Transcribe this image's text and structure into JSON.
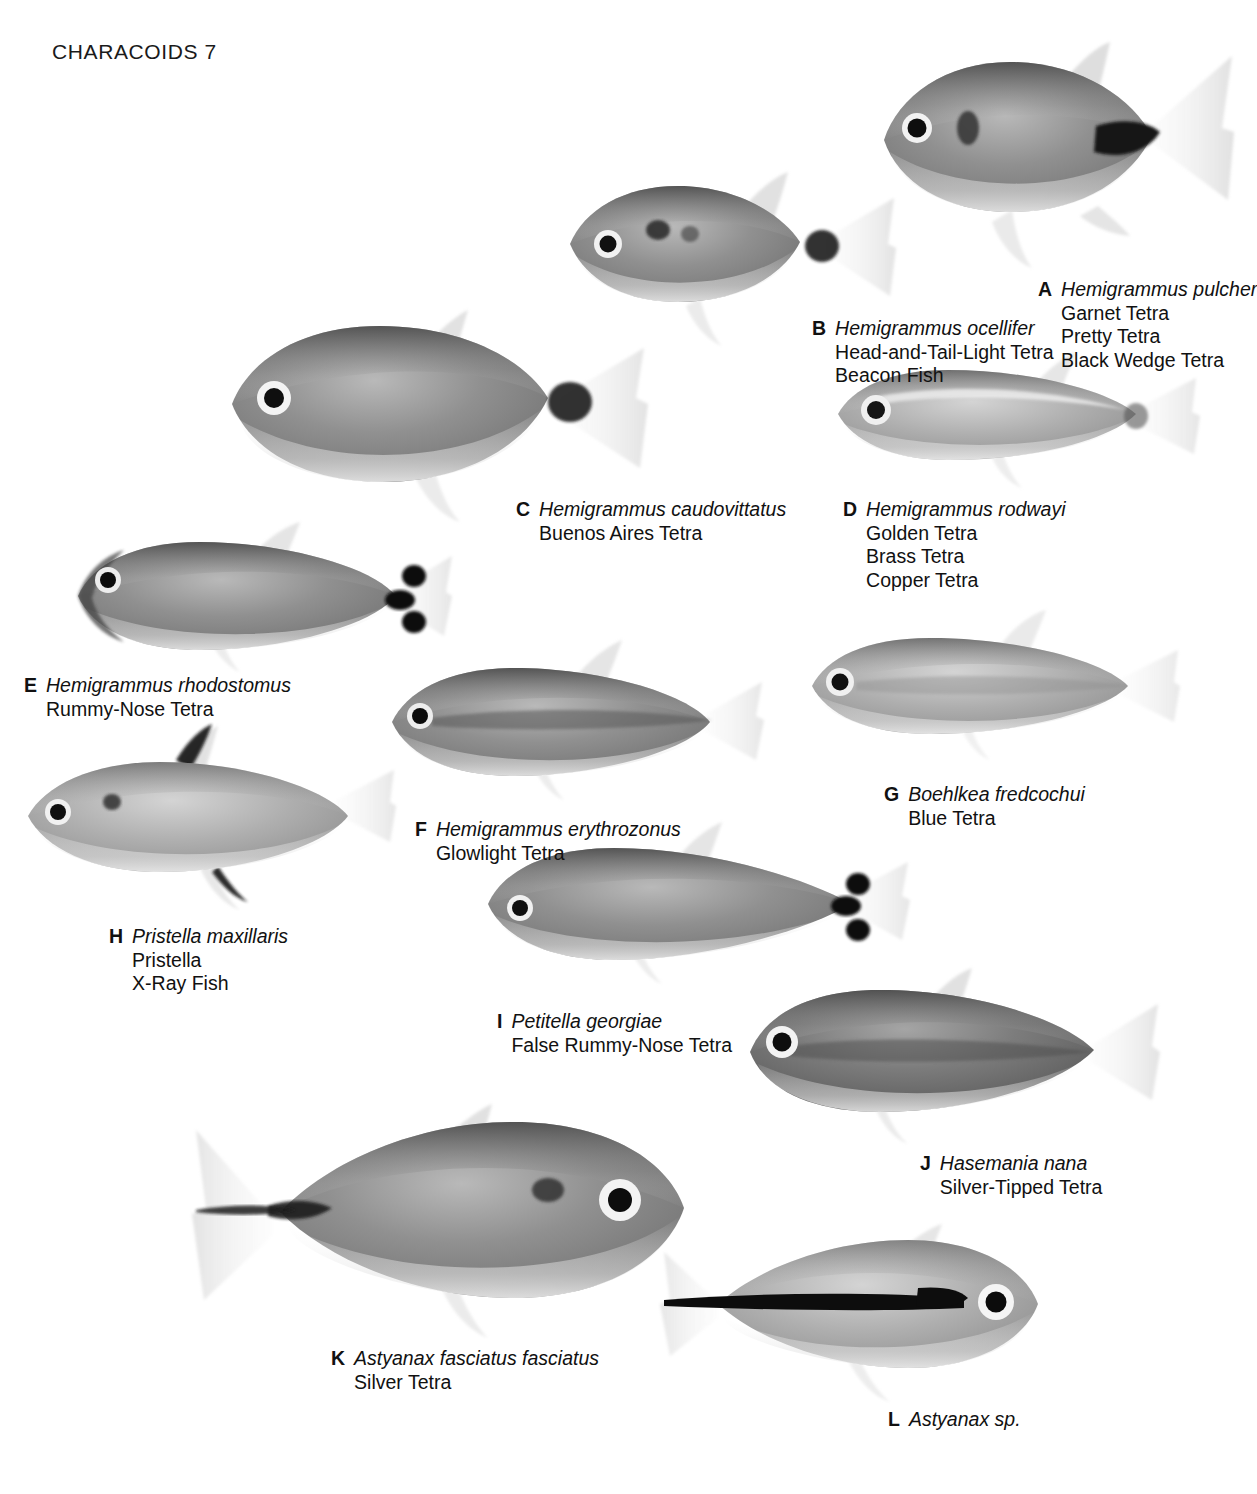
{
  "page": {
    "running_head": "CHARACOIDS 7",
    "background": "#ffffff",
    "ink": "#111111"
  },
  "plates": [
    {
      "letter": "A",
      "scientific_name": "Hemigrammus pulcher",
      "common_names": [
        "Garnet Tetra",
        "Pretty Tetra",
        "Black Wedge Tetra"
      ],
      "orientation": "left",
      "body_tone": "#7d7d7d",
      "marking": "black-wedge-caudal-peduncle"
    },
    {
      "letter": "B",
      "scientific_name": "Hemigrammus ocellifer",
      "common_names": [
        "Head-and-Tail-Light Tetra",
        "Beacon Fish"
      ],
      "orientation": "left",
      "body_tone": "#838383",
      "marking": "shoulder-spot-and-caudal-spot"
    },
    {
      "letter": "C",
      "scientific_name": "Hemigrammus caudovittatus",
      "common_names": [
        "Buenos Aires Tetra"
      ],
      "orientation": "left",
      "body_tone": "#8a8a8a",
      "marking": "dark-caudal-peduncle-blotch"
    },
    {
      "letter": "D",
      "scientific_name": "Hemigrammus rodwayi",
      "common_names": [
        "Golden Tetra",
        "Brass Tetra",
        "Copper Tetra"
      ],
      "orientation": "left",
      "body_tone": "#9a9a9a",
      "marking": "pale-silvery-flank"
    },
    {
      "letter": "E",
      "scientific_name": "Hemigrammus rhodostomus",
      "common_names": [
        "Rummy-Nose Tetra"
      ],
      "orientation": "left",
      "body_tone": "#8d8d8d",
      "marking": "three-black-caudal-bars"
    },
    {
      "letter": "F",
      "scientific_name": "Hemigrammus erythrozonus",
      "common_names": [
        "Glowlight Tetra"
      ],
      "orientation": "left",
      "body_tone": "#8f8f8f",
      "marking": "lateral-stripe"
    },
    {
      "letter": "G",
      "scientific_name": "Boehlkea fredcochui",
      "common_names": [
        "Blue Tetra"
      ],
      "orientation": "left",
      "body_tone": "#a2a2a2",
      "marking": "faint-lateral-line"
    },
    {
      "letter": "H",
      "scientific_name": "Pristella maxillaris",
      "common_names": [
        "Pristella",
        "X-Ray Fish"
      ],
      "orientation": "left",
      "body_tone": "#9d9d9d",
      "marking": "black-blotches-on-dorsal-and-anal-fins"
    },
    {
      "letter": "I",
      "scientific_name": "Petitella georgiae",
      "common_names": [
        "False Rummy-Nose Tetra"
      ],
      "orientation": "left",
      "body_tone": "#8e8e8e",
      "marking": "three-black-caudal-bars"
    },
    {
      "letter": "J",
      "scientific_name": "Hasemania nana",
      "common_names": [
        "Silver-Tipped Tetra"
      ],
      "orientation": "left",
      "body_tone": "#8b8b8b",
      "marking": "dark-lateral-band-to-tail"
    },
    {
      "letter": "K",
      "scientific_name": "Astyanax fasciatus fasciatus",
      "common_names": [
        "Silver Tetra"
      ],
      "orientation": "right",
      "body_tone": "#8c8c8c",
      "marking": "humeral-spot-and-caudal-streak"
    },
    {
      "letter": "L",
      "scientific_name": "Astyanax sp.",
      "common_names": [],
      "orientation": "right",
      "body_tone": "#a6a6a6",
      "marking": "bold-black-lateral-stripe"
    }
  ]
}
